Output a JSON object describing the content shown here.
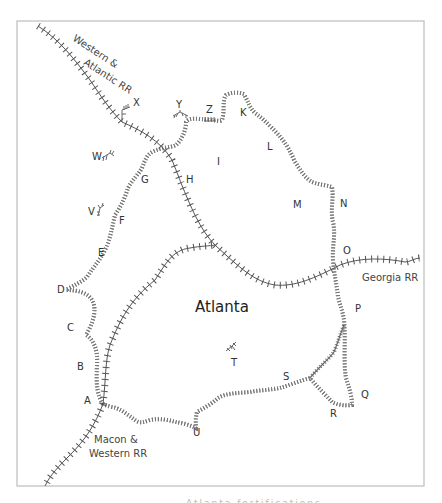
{
  "map": {
    "city_label": "Atlanta",
    "railroads": [
      {
        "id": "western-atlantic",
        "label_line1": "Western &",
        "label_line2": "Atlantic RR"
      },
      {
        "id": "georgia",
        "label": "Georgia RR"
      },
      {
        "id": "macon-western",
        "label_line1": "Macon &",
        "label_line2": "Western RR"
      }
    ],
    "fortification_points": [
      "A",
      "B",
      "C",
      "D",
      "E",
      "F",
      "G",
      "H",
      "I",
      "K",
      "L",
      "M",
      "N",
      "O",
      "P",
      "Q",
      "R",
      "S",
      "T",
      "U"
    ],
    "outlying_works": [
      "V",
      "W",
      "X",
      "Y",
      "Z"
    ],
    "labels": {
      "A": "A",
      "B": "B",
      "C": "C",
      "D": "D",
      "E": "E",
      "F": "F",
      "G": "G",
      "H": "H",
      "I": "I",
      "K": "K",
      "L": "L",
      "M": "M",
      "N": "N",
      "O": "O",
      "P": "P",
      "Q": "Q",
      "R": "R",
      "S": "S",
      "T": "T",
      "U": "U",
      "V": "V",
      "W": "W",
      "X": "X",
      "Y": "Y",
      "Z": "Z"
    },
    "colors": {
      "frame": "#bdbdbd",
      "railroad": "#555555",
      "earthworks": "#666666",
      "text": "#333333"
    }
  },
  "caption": {
    "partial_text": "Atlanta fortifications"
  }
}
